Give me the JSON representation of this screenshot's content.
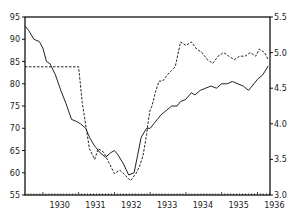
{
  "chart_data": {
    "type": "line",
    "title": "",
    "xlabel": "",
    "ylabel_left": "",
    "ylabel_right": "",
    "x_ticks": [
      "1930",
      "1931",
      "1932",
      "1933",
      "1934",
      "1935",
      "1936"
    ],
    "xlim": [
      1929.5,
      1936.35
    ],
    "ylim_left": [
      55,
      95
    ],
    "ylim_right": [
      3.0,
      5.5
    ],
    "y_ticks_left": [
      "55",
      "60",
      "65",
      "70",
      "75",
      "80",
      "85",
      "90",
      "95"
    ],
    "y_ticks_right": [
      "3.0",
      "3.5",
      "4.0",
      "4.5",
      "5.0",
      "5.5"
    ],
    "grid": false,
    "legend": null,
    "series": [
      {
        "name": "solid line (left axis)",
        "axis": "left",
        "style": "solid",
        "x": [
          1929.5,
          1929.6,
          1929.75,
          1929.9,
          1930.0,
          1930.1,
          1930.2,
          1930.35,
          1930.5,
          1930.65,
          1930.8,
          1930.95,
          1931.05,
          1931.2,
          1931.3,
          1931.45,
          1931.6,
          1931.75,
          1931.9,
          1932.0,
          1932.1,
          1932.25,
          1932.4,
          1932.55,
          1932.65,
          1932.75,
          1932.9,
          1933.0,
          1933.1,
          1933.2,
          1933.3,
          1933.45,
          1933.6,
          1933.75,
          1933.85,
          1934.0,
          1934.15,
          1934.25,
          1934.4,
          1934.55,
          1934.7,
          1934.85,
          1935.0,
          1935.15,
          1935.3,
          1935.45,
          1935.6,
          1935.75,
          1935.9,
          1936.0,
          1936.15,
          1936.3
        ],
        "values": [
          93,
          92,
          90,
          89.5,
          88,
          85,
          84.5,
          82,
          78.5,
          75.5,
          72,
          71.5,
          71,
          70,
          68,
          66,
          64.5,
          63.5,
          64.5,
          65,
          64,
          62,
          59.5,
          60,
          64,
          68,
          70,
          70,
          71,
          72,
          73,
          74,
          75,
          75,
          76,
          76.5,
          78,
          77.5,
          78.5,
          79,
          79.5,
          79,
          80,
          80,
          80.5,
          80,
          79.5,
          78.5,
          80,
          81,
          82,
          84
        ]
      },
      {
        "name": "dashed line (right axis)",
        "axis": "right",
        "style": "dashed",
        "x": [
          1929.5,
          1930.0,
          1930.5,
          1930.9,
          1931.0,
          1931.1,
          1931.3,
          1931.45,
          1931.55,
          1931.7,
          1931.85,
          1932.0,
          1932.15,
          1932.3,
          1932.45,
          1932.6,
          1932.7,
          1932.8,
          1932.9,
          1932.95,
          1933.0,
          1933.05,
          1933.15,
          1933.25,
          1933.35,
          1933.5,
          1933.6,
          1933.7,
          1933.85,
          1934.0,
          1934.15,
          1934.3,
          1934.45,
          1934.6,
          1934.75,
          1934.9,
          1935.05,
          1935.2,
          1935.35,
          1935.5,
          1935.65,
          1935.8,
          1935.95,
          1936.05,
          1936.2,
          1936.3
        ],
        "values": [
          4.8,
          4.8,
          4.8,
          4.8,
          4.8,
          4.3,
          3.65,
          3.5,
          3.65,
          3.6,
          3.45,
          3.3,
          3.35,
          3.28,
          3.2,
          3.3,
          3.4,
          3.55,
          3.85,
          4.05,
          4.2,
          4.25,
          4.45,
          4.6,
          4.6,
          4.7,
          4.75,
          4.8,
          5.15,
          5.1,
          5.15,
          5.05,
          5.0,
          4.9,
          4.85,
          4.95,
          5.0,
          4.95,
          4.9,
          4.95,
          4.95,
          5.0,
          4.95,
          5.05,
          5.0,
          4.9
        ]
      }
    ]
  }
}
